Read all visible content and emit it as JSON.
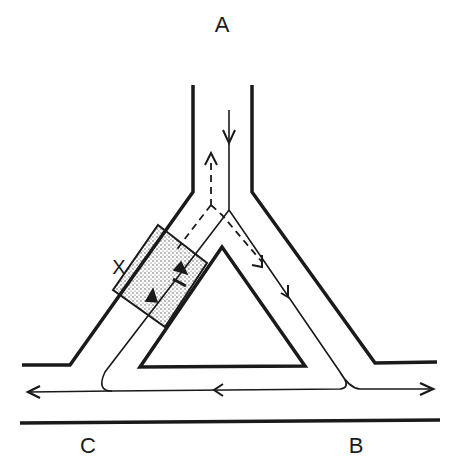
{
  "diagram": {
    "type": "flow-channel-junction",
    "labels": {
      "A": "A",
      "B": "B",
      "C": "C",
      "X": "X"
    },
    "colors": {
      "line": "#1a1a1a",
      "background": "#ffffff",
      "stipple": "#444444"
    },
    "flows": [
      {
        "id": "solid-main",
        "style": "solid",
        "path": "A down to junction, down right arm, along bottom channel toward C (left) and toward B (right)"
      },
      {
        "id": "dashed-up",
        "style": "dashed",
        "path": "junction up toward A"
      },
      {
        "id": "dashed-right",
        "style": "dashed",
        "path": "junction down right arm"
      },
      {
        "id": "solid-left-arm",
        "style": "solid",
        "path": "bottom channel up left arm through region X"
      }
    ]
  }
}
